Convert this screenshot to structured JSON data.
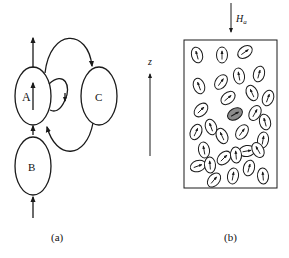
{
  "panel_a": {
    "caption": "(a)",
    "nodes": [
      {
        "id": "A",
        "label": "A"
      },
      {
        "id": "B",
        "label": "B"
      },
      {
        "id": "C",
        "label": "C"
      }
    ],
    "edges": [
      {
        "from": "B",
        "to": "A",
        "kind": "vertical-arrow"
      },
      {
        "from": "A",
        "to": "up",
        "kind": "vertical-arrow"
      },
      {
        "from": "input",
        "to": "B",
        "kind": "vertical-arrow"
      },
      {
        "from": "A",
        "to": "C",
        "kind": "arc-top"
      },
      {
        "from": "C",
        "to": "A",
        "kind": "arc-bottom"
      },
      {
        "from": "A",
        "to": "A",
        "kind": "self-loop"
      }
    ],
    "internal_arrow": "up"
  },
  "axis": {
    "label": "z",
    "direction": "up"
  },
  "panel_b": {
    "caption": "(b)",
    "field_label": "H",
    "field_subscript": "a",
    "field_direction": "down",
    "highlight_color": "#8c8c8c",
    "particle_count": 30,
    "highlighted_particle_count": 1
  }
}
